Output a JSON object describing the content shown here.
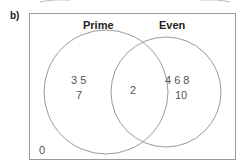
{
  "question_label": "b)",
  "sets": [
    {
      "name": "Prime",
      "only": [
        "3 5",
        "7"
      ]
    },
    {
      "name": "Even",
      "only": [
        "4 6 8",
        "10"
      ]
    }
  ],
  "intersection": "2",
  "outside": "0",
  "colors": {
    "outline": "#9a9a9a",
    "text": "#555555",
    "title": "#222222"
  }
}
